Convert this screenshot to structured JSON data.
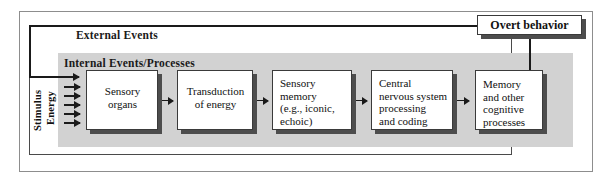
{
  "diagram": {
    "regions": {
      "external_label": "External Events",
      "internal_label": "Internal Events/Processes"
    },
    "input_label": {
      "line1": "Stimulus",
      "line2": "Energy",
      "arrow_count": 6
    },
    "stages": [
      {
        "name": "sensory-organs",
        "lines": [
          "Sensory",
          "organs"
        ],
        "align": "center"
      },
      {
        "name": "transduction",
        "lines": [
          "Transduction",
          "of energy"
        ],
        "align": "center"
      },
      {
        "name": "sensory-memory",
        "lines": [
          "Sensory",
          "memory",
          "(e.g., iconic,",
          "echoic)"
        ],
        "align": "left"
      },
      {
        "name": "central-nervous-system",
        "lines": [
          "Central",
          "nervous system",
          "processing",
          "and coding"
        ],
        "align": "left"
      },
      {
        "name": "memory-and-other-cognitive-processes",
        "lines": [
          "Memory",
          "and other",
          "cognitive",
          "processes"
        ],
        "align": "left"
      }
    ],
    "output": {
      "label": "Overt behavior"
    },
    "colors": {
      "internal_region_fill": "#d2d2d2",
      "box_fill": "#ffffff",
      "box_border": "#3a3a3a",
      "box_shadow": "#4d4d4d",
      "outer_frame_border": "#8d8d8d",
      "external_border": "#4a4a4a",
      "arrow": "#1a1a1a",
      "text": "#111111",
      "page_background": "#ffffff"
    }
  }
}
